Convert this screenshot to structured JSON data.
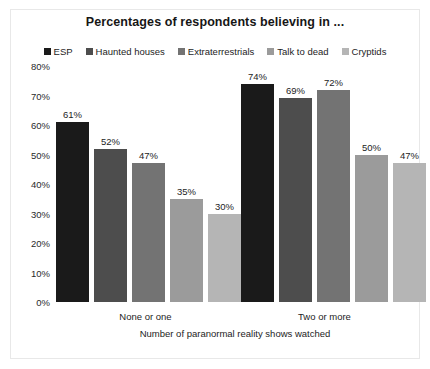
{
  "chart_data": {
    "type": "bar",
    "title": "Percentages of respondents believing in ...",
    "xlabel": "Number of paranormal reality shows watched",
    "ylabel": "",
    "ylim": [
      0,
      80
    ],
    "ytick_labels": [
      "80%",
      "70%",
      "60%",
      "50%",
      "40%",
      "30%",
      "20%",
      "10%",
      "0%"
    ],
    "ytick_values": [
      80,
      70,
      60,
      50,
      40,
      30,
      20,
      10,
      0
    ],
    "grid": false,
    "legend_position": "top",
    "categories": [
      "None or one",
      "Two or more"
    ],
    "series": [
      {
        "name": "ESP",
        "color": "#1a1a1a",
        "values": [
          61,
          74
        ],
        "labels": [
          "61%",
          "74%"
        ]
      },
      {
        "name": "Haunted houses",
        "color": "#4d4d4d",
        "values": [
          52,
          69
        ],
        "labels": [
          "52%",
          "69%"
        ]
      },
      {
        "name": "Extraterrestrials",
        "color": "#737373",
        "values": [
          47,
          72
        ],
        "labels": [
          "47%",
          "72%"
        ]
      },
      {
        "name": "Talk to dead",
        "color": "#9b9b9b",
        "values": [
          35,
          50
        ],
        "labels": [
          "35%",
          "50%"
        ]
      },
      {
        "name": "Cryptids",
        "color": "#b5b5b5",
        "values": [
          30,
          47
        ],
        "labels": [
          "30%",
          "47%"
        ]
      }
    ]
  }
}
